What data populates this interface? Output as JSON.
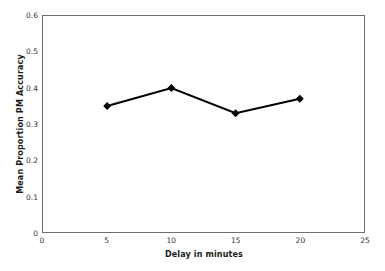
{
  "chart_data": {
    "type": "line",
    "title": "",
    "subtitle": "",
    "xlabel": "Delay in minutes",
    "ylabel": "Mean Proportion PM Accuracy",
    "x": [
      5,
      10,
      15,
      20
    ],
    "values": [
      0.35,
      0.4,
      0.33,
      0.37
    ],
    "series": [
      {
        "name": "Mean Proportion PM Accuracy",
        "x": [
          5,
          10,
          15,
          20
        ],
        "values": [
          0.35,
          0.4,
          0.33,
          0.37
        ]
      }
    ],
    "xlim": [
      0,
      25
    ],
    "ylim": [
      0,
      0.6
    ],
    "xticks": [
      0,
      5,
      10,
      15,
      20,
      25
    ],
    "yticks": [
      0,
      0.1,
      0.2,
      0.3,
      0.4,
      0.5,
      0.6
    ],
    "xtick_labels": [
      "0",
      "5",
      "10",
      "15",
      "20",
      "25"
    ],
    "ytick_labels": [
      "0",
      "0.1",
      "0.2",
      "0.3",
      "0.4",
      "0.5",
      "0.6"
    ],
    "grid": false,
    "legend": false,
    "legend_position": "none",
    "marker": "diamond",
    "line_color": "#000000",
    "marker_color": "#000000",
    "axis_color": "#6e6e6e",
    "background_color": "#ffffff",
    "annotations": []
  }
}
